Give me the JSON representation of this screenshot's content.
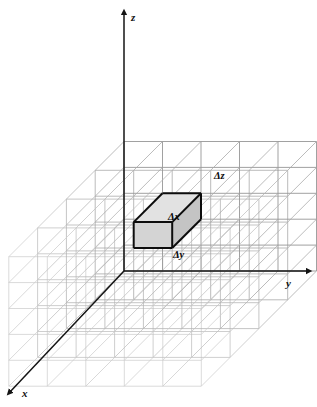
{
  "figure": {
    "kind": "3d-cartesian-grid-diagram",
    "background_color": "#ffffff",
    "width": 317,
    "height": 407
  },
  "axes": {
    "origin": {
      "x": 124,
      "y": 271
    },
    "color": "#141414",
    "items": [
      {
        "name": "z",
        "label": "z",
        "label_x": 131,
        "label_y": 12,
        "from": {
          "x": 124,
          "y": 271
        },
        "to": {
          "x": 124,
          "y": 12
        },
        "arrow": "up"
      },
      {
        "name": "y",
        "label": "y",
        "label_x": 286,
        "label_y": 278,
        "from": {
          "x": 124,
          "y": 271
        },
        "to": {
          "x": 309,
          "y": 271
        },
        "arrow": "right"
      },
      {
        "name": "x",
        "label": "x",
        "label_x": 22,
        "label_y": 388,
        "from": {
          "x": 124,
          "y": 271
        },
        "to": {
          "x": 9,
          "y": 393
        },
        "arrow": "down-left"
      }
    ]
  },
  "grid": {
    "line_color": "#b4b4b4",
    "line_color_front": "#9a9a9a",
    "line_color_back": "#c9c9c9",
    "cell_width_px": 38.5,
    "cell_height_px": 25.9,
    "depth_step_x_px": -28.8,
    "depth_step_y_px": 28.8,
    "columns_y": 5,
    "rows_z": 5,
    "layers_x": 4
  },
  "highlight_cell": {
    "name": "control-volume",
    "stroke_color": "#0d0d0d",
    "stroke_width": 2,
    "face_fill_front": "#d4d4d4",
    "face_fill_top": "#e2e2e2",
    "face_fill_right": "#c4c4c4",
    "labels": [
      {
        "name": "delta-x",
        "text": "Δx",
        "x": 168,
        "y": 212
      },
      {
        "name": "delta-y",
        "text": "Δy",
        "x": 173,
        "y": 250
      },
      {
        "name": "delta-z",
        "text": "Δz",
        "x": 214,
        "y": 171
      }
    ]
  }
}
